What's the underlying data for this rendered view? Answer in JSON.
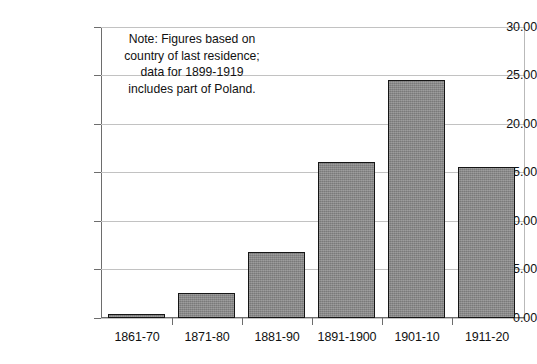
{
  "chart_data": {
    "type": "bar",
    "title": "",
    "subtitle": "",
    "xlabel": "",
    "ylabel": "",
    "categories": [
      "1861-70",
      "1871-80",
      "1881-90",
      "1891-1900",
      "1901-10",
      "1911-20"
    ],
    "values": [
      0.4,
      2.6,
      6.8,
      16.1,
      24.5,
      15.6
    ],
    "series": [
      {
        "name": "Immigration",
        "values": [
          0.4,
          2.6,
          6.8,
          16.1,
          24.5,
          15.6
        ]
      }
    ],
    "ylim": [
      0,
      30
    ],
    "ytick_values": [
      0,
      5,
      10,
      15,
      20,
      25,
      30
    ],
    "ytick_labels": [
      "0.00",
      "5.00",
      "10.00",
      "15.00",
      "20.00",
      "25.00",
      "30.00"
    ],
    "grid": true,
    "legend": false,
    "legend_position": "none",
    "bar_color": "#8a8a8a",
    "bar_edge_color": "#151515",
    "gridline_color": "#c2c2c2",
    "axis_color": "#6d6d6d",
    "text_color": "#111111",
    "background_color": "#ffffff",
    "annotations": [
      {
        "name": "source-note",
        "lines": [
          "Note: Figures based on",
          "country of last residence;",
          "data for 1899-1919",
          "includes part of Poland."
        ]
      }
    ]
  }
}
